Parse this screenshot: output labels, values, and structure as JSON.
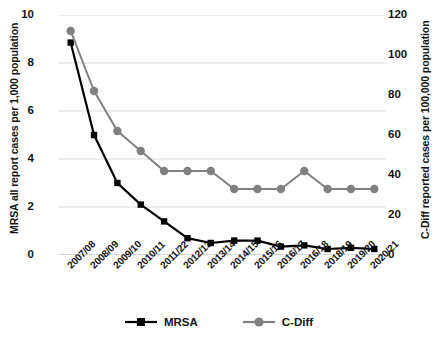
{
  "chart_data": {
    "type": "line",
    "title": "",
    "xlabel": "",
    "categories": [
      "2007/08",
      "2008/09",
      "2009/10",
      "2010/11",
      "2011/22",
      "2012/13",
      "2013/14",
      "2014/15",
      "2015/16",
      "2016/17",
      "2016/18",
      "2018/19",
      "2019/20",
      "2020/21"
    ],
    "grid": true,
    "legend_position": "bottom",
    "axes": {
      "left": {
        "label": "MRSA all report cases per 1,000 population",
        "ticks": [
          "0",
          "2",
          "4",
          "6",
          "8",
          "10"
        ],
        "tick_values": [
          0,
          2,
          4,
          6,
          8,
          10
        ],
        "ylim": [
          0,
          10
        ]
      },
      "right": {
        "label": "C-Diff reported cases per 100,000 population",
        "ticks": [
          "0",
          "20",
          "40",
          "60",
          "80",
          "100",
          "120"
        ],
        "tick_values": [
          0,
          20,
          40,
          60,
          80,
          100,
          120
        ],
        "ylim": [
          0,
          120
        ]
      }
    },
    "series": [
      {
        "name": "MRSA",
        "axis": "left",
        "color": "#000000",
        "marker": "square",
        "values": [
          8.85,
          5.0,
          3.0,
          2.1,
          1.4,
          0.7,
          0.5,
          0.6,
          0.6,
          0.35,
          0.4,
          0.25,
          0.3,
          0.25
        ]
      },
      {
        "name": "C-Diff",
        "axis": "right",
        "color": "#808080",
        "marker": "circle",
        "values": [
          112,
          82,
          62,
          52,
          42,
          42,
          42,
          33,
          33,
          33,
          42,
          33,
          33,
          33
        ]
      }
    ]
  },
  "legend": {
    "items": [
      {
        "label": "MRSA"
      },
      {
        "label": "C-Diff"
      }
    ]
  }
}
